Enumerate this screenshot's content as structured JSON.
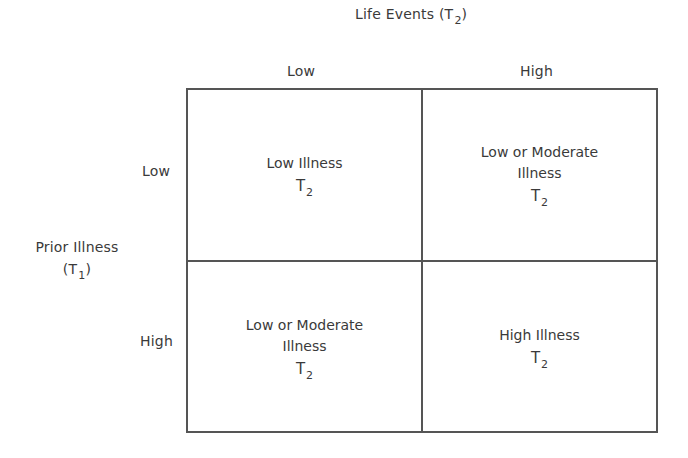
{
  "column_axis": {
    "title": "Life Events",
    "title_var": "T",
    "title_sub": "2",
    "levels": [
      "Low",
      "High"
    ]
  },
  "row_axis": {
    "title": "Prior Illness",
    "title_var": "T",
    "title_sub": "1",
    "levels": [
      "Low",
      "High"
    ]
  },
  "cells": [
    {
      "row": "Low",
      "col": "Low",
      "lines": [
        "Low Illness"
      ],
      "var": "T",
      "sub": "2"
    },
    {
      "row": "Low",
      "col": "High",
      "lines": [
        "Low or Moderate",
        "Illness"
      ],
      "var": "T",
      "sub": "2"
    },
    {
      "row": "High",
      "col": "Low",
      "lines": [
        "Low or Moderate",
        "Illness"
      ],
      "var": "T",
      "sub": "2"
    },
    {
      "row": "High",
      "col": "High",
      "lines": [
        "High Illness"
      ],
      "var": "T",
      "sub": "2"
    }
  ],
  "colors": {
    "text": "#3a3a3a",
    "lines": "#555555",
    "background": "#ffffff"
  }
}
